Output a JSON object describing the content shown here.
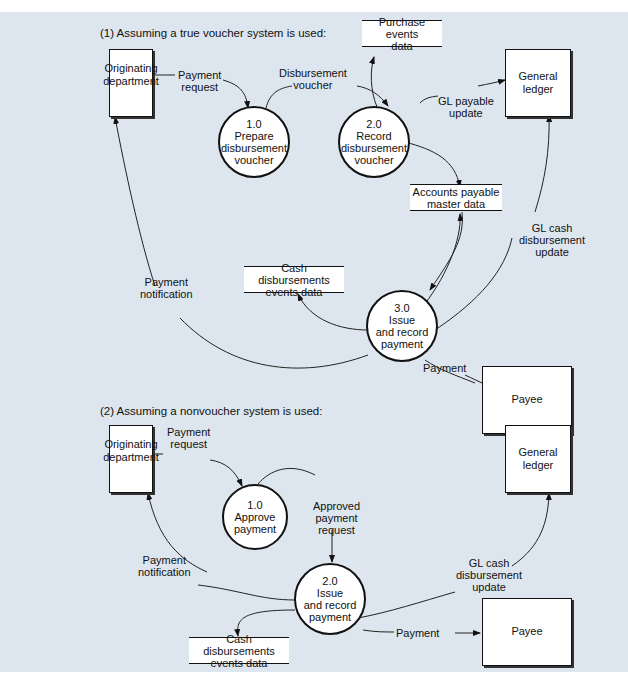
{
  "diagram": {
    "background_color": "#dde6ee",
    "part1": {
      "heading": "(1) Assuming a true voucher system is used:",
      "entities": {
        "originating": [
          "Originating",
          "department"
        ],
        "general_ledger": [
          "General",
          "ledger"
        ],
        "payee": [
          "Payee"
        ]
      },
      "processes": {
        "p1": {
          "number": "1.0",
          "lines": [
            "Prepare",
            "disbursement",
            "voucher"
          ]
        },
        "p2": {
          "number": "2.0",
          "lines": [
            "Record",
            "disbursement",
            "voucher"
          ]
        },
        "p3": {
          "number": "3.0",
          "lines": [
            "Issue",
            "and record",
            "payment"
          ]
        }
      },
      "stores": {
        "purchase_events": [
          "Purchase events",
          "data"
        ],
        "ap_master": [
          "Accounts payable",
          "master data"
        ],
        "cash_disb": [
          "Cash disbursements",
          "events data"
        ]
      },
      "flows": {
        "payment_request": [
          "Payment",
          "request"
        ],
        "disbursement_voucher": [
          "Disbursement",
          "voucher"
        ],
        "gl_payable_update": [
          "GL payable",
          "update"
        ],
        "gl_cash_update": [
          "GL cash",
          "disbursement",
          "update"
        ],
        "payment_notification": [
          "Payment",
          "notification"
        ],
        "payment": [
          "Payment"
        ]
      }
    },
    "part2": {
      "heading": "(2) Assuming a nonvoucher system is used:",
      "entities": {
        "originating": [
          "Originating",
          "department"
        ],
        "general_ledger": [
          "General",
          "ledger"
        ],
        "payee": [
          "Payee"
        ]
      },
      "processes": {
        "p1": {
          "number": "1.0",
          "lines": [
            "Approve",
            "payment"
          ]
        },
        "p2": {
          "number": "2.0",
          "lines": [
            "Issue",
            "and record",
            "payment"
          ]
        }
      },
      "stores": {
        "cash_disb": [
          "Cash disbursements",
          "events data"
        ]
      },
      "flows": {
        "payment_request": [
          "Payment",
          "request"
        ],
        "approved_payment_request": [
          "Approved",
          "payment",
          "request"
        ],
        "payment_notification": [
          "Payment",
          "notification"
        ],
        "gl_cash_update": [
          "GL cash",
          "disbursement",
          "update"
        ],
        "payment": [
          "Payment"
        ]
      }
    }
  }
}
